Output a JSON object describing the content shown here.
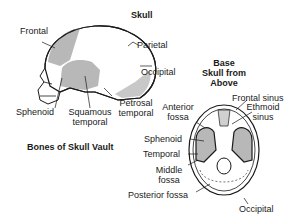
{
  "titles": {
    "skull": "Skull",
    "vault": "Bones of Skull Vault",
    "base_line1": "Base",
    "base_line2": "Skull from",
    "base_line3": "Above"
  },
  "lateral_labels": {
    "frontal": "Frontal",
    "parietal": "Parietal",
    "occipital": "Occipital",
    "sphenoid": "Sphenoid",
    "squamous_1": "Squamous",
    "squamous_2": "temporal",
    "petrosal_1": "Petrosal",
    "petrosal_2": "temporal"
  },
  "base_labels": {
    "anterior_1": "Anterior",
    "anterior_2": "fossa",
    "frontal_sinus": "Frontal sinus",
    "ethmoid_1": "Ethmoid",
    "ethmoid_2": "sinus",
    "sphenoid": "Sphenoid",
    "temporal": "Temporal",
    "middle_1": "Middle",
    "middle_2": "fossa",
    "posterior": "Posterior fossa",
    "occipital": "Occipital"
  },
  "colors": {
    "bone_shade": "#b8b8b8",
    "outline": "#1a1a1a",
    "background": "#ffffff"
  }
}
